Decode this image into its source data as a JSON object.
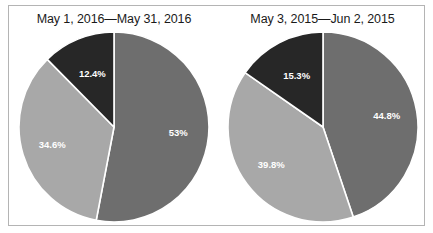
{
  "figure": {
    "background_color": "#ffffff",
    "border_color": "#b4b4b4"
  },
  "palette": {
    "dark": "#272727",
    "medium": "#6e6e6e",
    "light": "#a8a8a8",
    "separator": "#ffffff",
    "label_text": "#ffffff",
    "title_text": "#1a1a1a"
  },
  "chart_data": [
    {
      "type": "pie",
      "title": "May 1, 2016—May 31, 2016",
      "categories": [
        "Segment 1",
        "Segment 2",
        "Segment 3"
      ],
      "values": [
        53,
        34.6,
        12.4
      ],
      "labels": [
        "53%",
        "34.6%",
        "12.4%"
      ],
      "colors": [
        "#6e6e6e",
        "#a8a8a8",
        "#272727"
      ],
      "start_angle_deg": 0,
      "direction": "clockwise",
      "legend": "none",
      "grid": false
    },
    {
      "type": "pie",
      "title": "May 3, 2015—Jun 2, 2015",
      "categories": [
        "Segment 1",
        "Segment 2",
        "Segment 3"
      ],
      "values": [
        44.8,
        39.8,
        15.3
      ],
      "labels": [
        "44.8%",
        "39.8%",
        "15.3%"
      ],
      "colors": [
        "#6e6e6e",
        "#a8a8a8",
        "#272727"
      ],
      "start_angle_deg": 0,
      "direction": "clockwise",
      "legend": "none",
      "grid": false
    }
  ]
}
